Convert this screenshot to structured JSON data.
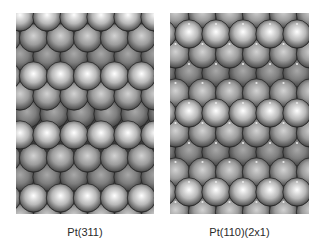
{
  "figure": {
    "panels": [
      {
        "id": "pt311",
        "caption": "Pt(311)",
        "description": "Hard-sphere model of Pt(311) surface",
        "box": {
          "x": 16,
          "y": 13,
          "w": 138,
          "h": 201
        },
        "lattice": {
          "atom_spacing_x": 27,
          "radius": 14.2,
          "rows": [
            {
              "y": 4,
              "x0": 4,
              "shade": "bright"
            },
            {
              "y": 25,
              "x0": 17.5,
              "shade": "medium"
            },
            {
              "y": 43,
              "x0": 4,
              "shade": "dark"
            },
            {
              "y": 63,
              "x0": 17.5,
              "shade": "bright"
            },
            {
              "y": 83,
              "x0": 4,
              "shade": "medium"
            },
            {
              "y": 101,
              "x0": 11,
              "shade": "dark"
            },
            {
              "y": 122,
              "x0": 4,
              "shade": "bright"
            },
            {
              "y": 145,
              "x0": 17.5,
              "shade": "medium"
            },
            {
              "y": 164,
              "x0": 4,
              "shade": "dark"
            },
            {
              "y": 185,
              "x0": 17.5,
              "shade": "bright"
            },
            {
              "y": 205,
              "x0": 4,
              "shade": "medium"
            }
          ]
        }
      },
      {
        "id": "pt110-2x1",
        "caption": "Pt(110)(2x1)",
        "description": "Hard-sphere model of missing-row reconstructed Pt(110)(2x1) surface",
        "box": {
          "x": 170,
          "y": 13,
          "w": 139,
          "h": 201
        },
        "lattice": {
          "atom_spacing_x": 27,
          "radius": 14.2,
          "rows": [
            {
              "y": 1,
              "x0": 5.5,
              "shade": "medium"
            },
            {
              "y": 21,
              "x0": 19,
              "shade": "bright"
            },
            {
              "y": 41,
              "x0": 5.5,
              "shade": "medium"
            },
            {
              "y": 60,
              "x0": 19,
              "shade": "dark"
            },
            {
              "y": 80,
              "x0": 5.5,
              "shade": "medium"
            },
            {
              "y": 100,
              "x0": 19,
              "shade": "bright"
            },
            {
              "y": 120,
              "x0": 5.5,
              "shade": "medium"
            },
            {
              "y": 139,
              "x0": 19,
              "shade": "dark"
            },
            {
              "y": 159,
              "x0": 5.5,
              "shade": "medium"
            },
            {
              "y": 179,
              "x0": 19,
              "shade": "bright"
            },
            {
              "y": 199,
              "x0": 5.5,
              "shade": "medium"
            }
          ],
          "junction_dots": true
        }
      }
    ],
    "shades": {
      "bright": {
        "center": "#ffffff",
        "mid": "#b8b8b8",
        "edge": "#5e5e5e"
      },
      "medium": {
        "center": "#d2d2d2",
        "mid": "#9c9c9c",
        "edge": "#565656"
      },
      "dark": {
        "center": "#a8a8a8",
        "mid": "#7e7e7e",
        "edge": "#4a4a4a"
      }
    },
    "background_gap_color": "#3a3a3a",
    "caption_color": "#2b2b2b"
  }
}
